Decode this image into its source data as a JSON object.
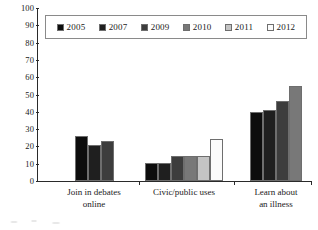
{
  "chart_data": {
    "type": "bar",
    "title": "",
    "xlabel": "",
    "ylabel": "",
    "ylim": [
      0,
      100
    ],
    "ytick_step": 10,
    "yticks": [
      100,
      90,
      80,
      70,
      60,
      50,
      40,
      30,
      20,
      10,
      0
    ],
    "grid": false,
    "legend_position": "top-center",
    "categories": [
      "Join in debates\nonline",
      "Civic/public uses",
      "Learn about\nan illness"
    ],
    "series": [
      {
        "name": "2005",
        "color": "#0d0d0d",
        "values": [
          26,
          10.5,
          40
        ]
      },
      {
        "name": "2007",
        "color": "#1f1f1f",
        "values": [
          21,
          10.5,
          41
        ]
      },
      {
        "name": "2009",
        "color": "#3d3d3d",
        "values": [
          23,
          14.5,
          46
        ]
      },
      {
        "name": "2010",
        "color": "#787878",
        "values": [
          null,
          14.5,
          55
        ]
      },
      {
        "name": "2011",
        "color": "#c4c4c4",
        "values": [
          null,
          14.5,
          null
        ]
      },
      {
        "name": "2012",
        "color": "#fbfbfb",
        "values": [
          null,
          24.5,
          null
        ]
      }
    ]
  },
  "legend": {
    "items": [
      {
        "label": "2005",
        "color": "#0d0d0d"
      },
      {
        "label": "2007",
        "color": "#1f1f1f"
      },
      {
        "label": "2009",
        "color": "#3d3d3d"
      },
      {
        "label": "2010",
        "color": "#787878"
      },
      {
        "label": "2011",
        "color": "#c4c4c4"
      },
      {
        "label": "2012",
        "color": "#fbfbfb"
      }
    ]
  },
  "axis": {
    "y_labels": [
      "100",
      "90",
      "80",
      "70",
      "60",
      "50",
      "40",
      "30",
      "20",
      "10",
      "0"
    ],
    "x_labels": [
      "Join in debates\nonline",
      "Civic/public uses",
      "Learn about\nan illness"
    ]
  },
  "colors": {
    "axis": "#2a2a2a",
    "text": "#1a1a1a",
    "bar_outline": "#6e6e6e",
    "legend_border": "#8a8a8a",
    "background": "#ffffff"
  }
}
